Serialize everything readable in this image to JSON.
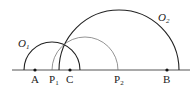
{
  "diagram": {
    "baseline": {
      "x1": 12,
      "x2": 190,
      "y": 70
    },
    "points": [
      {
        "label": "A",
        "x": 35
      },
      {
        "label": "C",
        "x": 70
      },
      {
        "label": "B",
        "x": 167
      }
    ],
    "markers": [
      {
        "label": "P",
        "sub": "1",
        "x": 53
      },
      {
        "label": "P",
        "sub": "2",
        "x": 118
      }
    ],
    "circles": [
      {
        "name": "O",
        "sub": "1",
        "cx": 52,
        "r": 28,
        "label_x": 18,
        "label_y": 46
      },
      {
        "name": "O",
        "sub": "2",
        "cx": 119,
        "r": 60,
        "label_x": 158,
        "label_y": 21
      },
      {
        "name": "",
        "cx": 85,
        "r": 33,
        "thin": true
      }
    ],
    "labels": {
      "A": "A",
      "C": "C",
      "B": "B",
      "P1": "P",
      "P1_sub": "1",
      "P2": "P",
      "P2_sub": "2",
      "O1": "O",
      "O1_sub": "1",
      "O2": "O",
      "O2_sub": "2"
    }
  }
}
